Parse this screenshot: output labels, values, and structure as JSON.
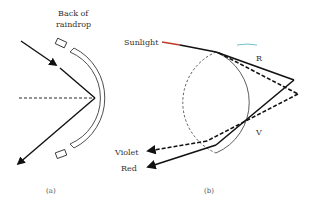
{
  "panel_a": {
    "label_back": [
      "Back of",
      "raindrop"
    ],
    "caption": "(a)"
  },
  "panel_b": {
    "label_sunlight": "Sunlight",
    "label_R": "R",
    "label_V": "V",
    "label_violet": "Violet",
    "label_red": "Red",
    "caption": "(b)"
  },
  "colors": {
    "line": "#111111",
    "text": "#333333",
    "sunlight_accent": "#c0392b",
    "circle_accent": "#4fb3bf"
  }
}
